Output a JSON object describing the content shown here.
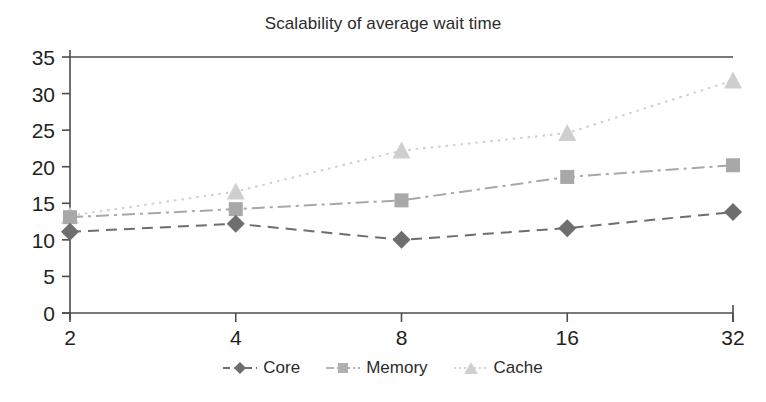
{
  "chart_data": {
    "type": "line",
    "title": "Scalability of average wait time",
    "xlabel": "",
    "ylabel": "",
    "categories": [
      "2",
      "4",
      "8",
      "16",
      "32"
    ],
    "x": [
      2,
      4,
      8,
      16,
      32
    ],
    "xscale": "log2-even-spacing",
    "xtick_labels": [
      "2",
      "4",
      "8",
      "16",
      "32"
    ],
    "ytick_labels": [
      "0",
      "5",
      "10",
      "15",
      "20",
      "25",
      "30",
      "35"
    ],
    "yticks": [
      0,
      5,
      10,
      15,
      20,
      25,
      30,
      35
    ],
    "ylim": [
      0,
      35
    ],
    "grid": false,
    "legend_position": "bottom-center",
    "series": [
      {
        "name": "Core",
        "values": [
          11.1,
          12.2,
          10.0,
          11.6,
          13.8
        ],
        "color": "#6e6e6e",
        "marker": "diamond",
        "linestyle": "dashed"
      },
      {
        "name": "Memory",
        "values": [
          13.1,
          14.2,
          15.4,
          18.6,
          20.2
        ],
        "color": "#a8a8a8",
        "marker": "square",
        "linestyle": "dash-dot"
      },
      {
        "name": "Cache",
        "values": [
          13.3,
          16.6,
          22.2,
          24.6,
          31.8
        ],
        "color": "#cfcfcf",
        "marker": "triangle",
        "linestyle": "dotted"
      }
    ]
  },
  "legend": {
    "items": [
      {
        "label": "Core"
      },
      {
        "label": "Memory"
      },
      {
        "label": "Cache"
      }
    ]
  }
}
